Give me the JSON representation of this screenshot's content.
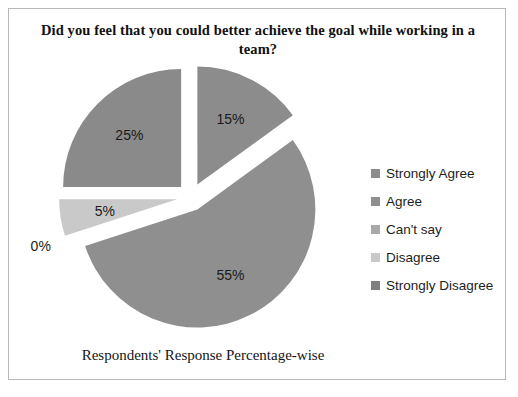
{
  "chart_data": {
    "type": "pie",
    "title": "Did you feel that you could better achieve the goal while working in a team?",
    "xlabel": "Respondents' Response Percentage-wise",
    "ylabel": "",
    "exploded": true,
    "legend_position": "right",
    "grid": false,
    "categories": [
      "Strongly Agree",
      "Agree",
      "Can't say",
      "Disagree",
      "Strongly Disagree"
    ],
    "values": [
      15,
      55,
      0,
      5,
      25
    ],
    "data_labels": [
      "15%",
      "55%",
      "0%",
      "5%",
      "25%"
    ],
    "colors": [
      "#8c8c8c",
      "#8f8f8f",
      "#a8a8a8",
      "#c9c9c9",
      "#8a8a8a"
    ],
    "slices": [
      {
        "label": "Strongly Agree",
        "value": 15,
        "data_label": "15%",
        "color": "#8c8c8c"
      },
      {
        "label": "Agree",
        "value": 55,
        "data_label": "55%",
        "color": "#8f8f8f"
      },
      {
        "label": "Can't say",
        "value": 0,
        "data_label": "0%",
        "color": "#a8a8a8"
      },
      {
        "label": "Disagree",
        "value": 5,
        "data_label": "5%",
        "color": "#c9c9c9"
      },
      {
        "label": "Strongly Disagree",
        "value": 25,
        "data_label": "25%",
        "color": "#8a8a8a"
      }
    ]
  },
  "legend": {
    "items": [
      {
        "label": "Strongly Agree",
        "color": "#8c8c8c"
      },
      {
        "label": "Agree",
        "color": "#8f8f8f"
      },
      {
        "label": "Can't say",
        "color": "#a8a8a8"
      },
      {
        "label": "Disagree",
        "color": "#c9c9c9"
      },
      {
        "label": "Strongly Disagree",
        "color": "#7f7f7f"
      }
    ]
  }
}
